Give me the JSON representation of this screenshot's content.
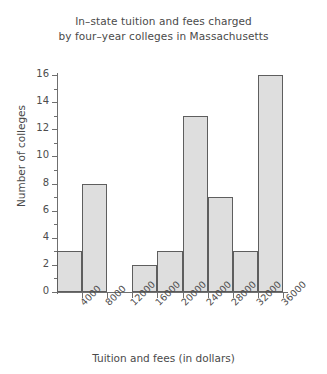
{
  "chart_data": {
    "type": "bar",
    "title_line1": "In–state tuition and fees charged",
    "title_line2": "by four–year colleges in Massachusetts",
    "xlabel": "Tuition and fees (in dollars)",
    "ylabel": "Number of colleges",
    "categories": [
      "0–4000",
      "4000–8000",
      "8000–12000",
      "12000–16000",
      "16000–20000",
      "20000–24000",
      "24000–28000",
      "28000–32000",
      "32000–36000"
    ],
    "values": [
      3,
      8,
      0,
      2,
      3,
      13,
      7,
      3,
      16
    ],
    "bin_edges": [
      0,
      4000,
      8000,
      12000,
      16000,
      20000,
      24000,
      28000,
      32000,
      36000
    ],
    "x_tick_labels": [
      "4000",
      "8000",
      "12000",
      "16000",
      "20000",
      "24000",
      "28000",
      "32000",
      "36000"
    ],
    "y_tick_labels": [
      "0",
      "2",
      "4",
      "6",
      "8",
      "10",
      "12",
      "14",
      "16"
    ],
    "y_ticks": [
      0,
      2,
      4,
      6,
      8,
      10,
      12,
      14,
      16
    ],
    "ylim": [
      0,
      16
    ],
    "xlim": [
      0,
      36000
    ],
    "grid": false,
    "legend": null,
    "bar_fill_color": "#dedede",
    "bar_border_color": "#5e5e5e",
    "axis_color": "#6f6f6f",
    "text_color": "#4a4a4a"
  }
}
